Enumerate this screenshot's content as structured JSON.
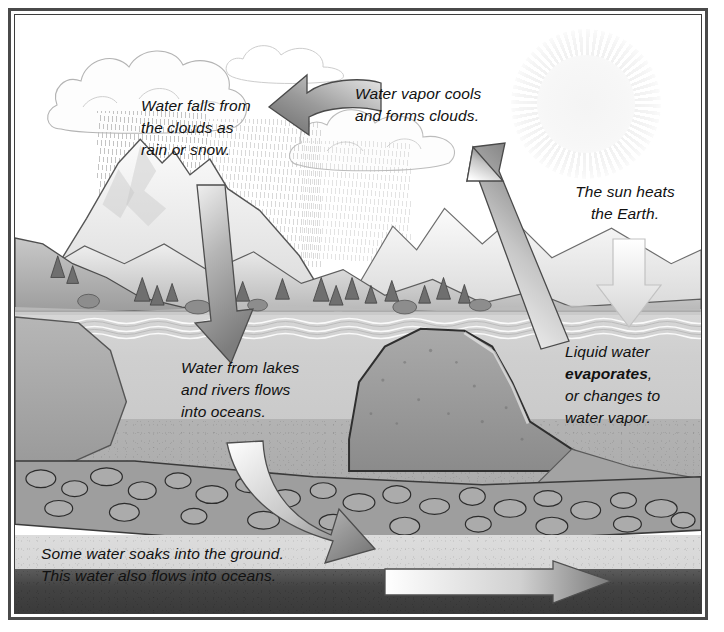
{
  "diagram": {
    "style": "grayscale pencil illustration with black double-line frame",
    "labels": {
      "precipitation": "Water falls from\nthe clouds as\nrain or snow.",
      "condensation": "Water vapor cools\nand forms clouds.",
      "solar": "The sun heats\nthe Earth.",
      "evaporation_pre": "Liquid water\n",
      "evaporation_term": "evaporates",
      "evaporation_post": ",\nor changes to\nwater vapor.",
      "runoff": "Water from lakes\nand rivers flows\ninto oceans.",
      "groundwater": "Some water soaks into the ground.\nThis water also flows into oceans."
    },
    "arrows": [
      {
        "name": "condensation-arrow",
        "direction": "curved-left",
        "shade": "dark-gray",
        "meaning": "water vapor cools and forms clouds"
      },
      {
        "name": "precipitation-arrow",
        "direction": "down",
        "shade": "light-to-dark-gray",
        "meaning": "rain and snow fall to the ground"
      },
      {
        "name": "evaporation-arrow",
        "direction": "up-left-diagonal",
        "shade": "light-to-dark-gray",
        "meaning": "water vapor rises from the ocean"
      },
      {
        "name": "solar-arrow",
        "direction": "down",
        "shade": "very-light-gray",
        "meaning": "sun heats the Earth"
      },
      {
        "name": "runoff-arrow",
        "direction": "curved-down-right",
        "shade": "white-to-dark-gray",
        "meaning": "surface water flows into oceans"
      },
      {
        "name": "groundwater-arrow",
        "direction": "right",
        "shade": "white-to-gray",
        "meaning": "groundwater flows into oceans"
      }
    ],
    "scenery": [
      {
        "name": "sun",
        "description": "faint radiating sun in upper right sky"
      },
      {
        "name": "cloud-group",
        "description": "outlined cumulus clouds across the upper sky"
      },
      {
        "name": "rain-hatching",
        "description": "fine diagonal lines beneath clouds showing falling rain"
      },
      {
        "name": "mountain-range",
        "description": "snow-capped peaks with evergreen trees on the left"
      },
      {
        "name": "ocean",
        "description": "wavy water surface filling the middle of the scene"
      },
      {
        "name": "rock-outcrop",
        "description": "large stippled boulder rising from the seabed"
      },
      {
        "name": "aquifer",
        "description": "layer of outlined pebbles and stones under the ground"
      },
      {
        "name": "bedrock",
        "description": "dark solid rock band along the bottom"
      }
    ]
  },
  "colors": {
    "frame": "#4a4a4a",
    "ink": "#111111",
    "arrow_dark": "#6e6e6e",
    "arrow_light": "#f2f2f2",
    "water": "#cfcfcf",
    "bedrock": "#3f3f3f"
  }
}
